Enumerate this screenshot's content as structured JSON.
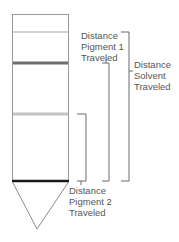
{
  "diagram": {
    "labels": {
      "pigment1": [
        "Distance",
        "Pigment 1",
        "Traveled"
      ],
      "solvent": [
        "Distance",
        "Solvent",
        "Traveled"
      ],
      "pigment2": [
        "Distance",
        "Pigment 2",
        "Traveled"
      ]
    },
    "colors": {
      "strip_outline": "#9a9a9a",
      "solvent_front": "#a8a8a8",
      "pigment1_band": "#6e6e6e",
      "pigment2_band": "#c4c4c4",
      "origin_line": "#1a1a1a",
      "bracket": "#6a6a6a",
      "text": "#555555"
    }
  }
}
